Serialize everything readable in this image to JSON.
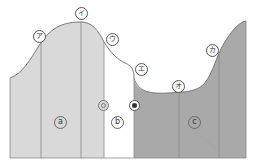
{
  "figure": {
    "colors": {
      "light_fill": "#d9d9d9",
      "dark_fill": "#a9a9a9",
      "white_fill": "#ffffff",
      "curve": "#777777",
      "divider": "#888888"
    },
    "curve_labels": [
      {
        "id": "a",
        "text": "ア"
      },
      {
        "id": "i",
        "text": "イ"
      },
      {
        "id": "u",
        "text": "ウ"
      },
      {
        "id": "e",
        "text": "エ"
      },
      {
        "id": "o",
        "text": "オ"
      },
      {
        "id": "ka",
        "text": "カ"
      }
    ],
    "regions": [
      {
        "id": "a",
        "text": "a"
      },
      {
        "id": "b",
        "text": "b"
      },
      {
        "id": "c",
        "text": "c"
      }
    ],
    "markers": [
      {
        "id": "double-circle",
        "symbol": "◎"
      },
      {
        "id": "solid-dot",
        "symbol": "●"
      }
    ]
  }
}
